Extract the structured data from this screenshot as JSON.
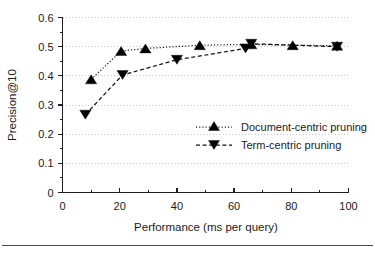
{
  "chart_data": {
    "type": "line",
    "title": "",
    "xlabel": "Performance (ms per query)",
    "ylabel": "Precision@10",
    "xlim": [
      0,
      100
    ],
    "ylim": [
      0,
      0.6
    ],
    "grid": "horizontal-dotted",
    "legend_position": "center-right-inside",
    "x_ticks": [
      0,
      20,
      40,
      60,
      80,
      100
    ],
    "x_tick_labels": [
      "0",
      "20",
      "40",
      "60",
      "80",
      "100"
    ],
    "x_minor_ticks": [
      10,
      30,
      50,
      70,
      90
    ],
    "y_ticks": [
      0,
      0.1,
      0.2,
      0.3,
      0.4,
      0.5,
      0.6
    ],
    "y_tick_labels": [
      "0",
      "0.1",
      "0.2",
      "0.3",
      "0.4",
      "0.5",
      "0.6"
    ],
    "y_minor_ticks": [
      0.05,
      0.15,
      0.25,
      0.35,
      0.45,
      0.55
    ],
    "series": [
      {
        "name": "Document-centric pruning",
        "marker": "triangle-up",
        "linestyle": "dotted",
        "color": "#000000",
        "points": [
          {
            "x": 10.0,
            "y": 0.388
          },
          {
            "x": 20.5,
            "y": 0.485
          },
          {
            "x": 29.0,
            "y": 0.494
          },
          {
            "x": 48.0,
            "y": 0.505
          },
          {
            "x": 66.0,
            "y": 0.508
          },
          {
            "x": 80.5,
            "y": 0.505
          },
          {
            "x": 96.0,
            "y": 0.503
          }
        ]
      },
      {
        "name": "Term-centric pruning",
        "marker": "triangle-down",
        "linestyle": "dashed",
        "color": "#000000",
        "points": [
          {
            "x": 8.0,
            "y": 0.267
          },
          {
            "x": 21.0,
            "y": 0.403
          },
          {
            "x": 40.0,
            "y": 0.455
          },
          {
            "x": 64.0,
            "y": 0.494
          },
          {
            "x": 66.0,
            "y": 0.51
          },
          {
            "x": 96.0,
            "y": 0.5
          }
        ]
      }
    ]
  },
  "legend": {
    "entries": [
      {
        "label": "Document-centric pruning",
        "marker": "triangle-up",
        "linestyle": "dotted"
      },
      {
        "label": "Term-centric pruning",
        "marker": "triangle-down",
        "linestyle": "dashed"
      }
    ]
  }
}
